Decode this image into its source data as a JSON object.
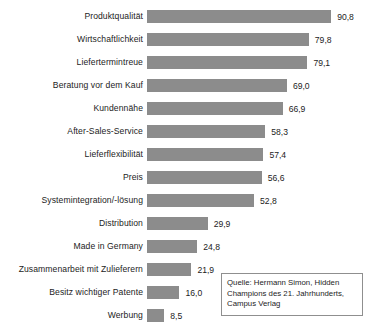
{
  "chart_data": {
    "type": "bar",
    "orientation": "horizontal",
    "title": "",
    "xlabel": "",
    "ylabel": "",
    "grid": false,
    "legend": null,
    "xlim": [
      0,
      100
    ],
    "value_format": "german-decimal-comma",
    "bar_color": "#8c8c8c",
    "categories": [
      "Produktqualität",
      "Wirtschaftlichkeit",
      "Liefertermintreue",
      "Beratung vor dem Kauf",
      "Kundennähe",
      "After-Sales-Service",
      "Lieferflexibilität",
      "Preis",
      "Systemintegration/-lösung",
      "Distribution",
      "Made in Germany",
      "Zusammenarbeit mit Zulieferern",
      "Besitz wichtiger Patente",
      "Werbung"
    ],
    "values": [
      90.8,
      79.8,
      79.1,
      69.0,
      66.9,
      58.3,
      57.4,
      56.6,
      52.8,
      29.9,
      24.8,
      21.9,
      16.0,
      8.5
    ],
    "value_labels": [
      "90,8",
      "79,8",
      "79,1",
      "69,0",
      "66,9",
      "58,3",
      "57,4",
      "56,6",
      "52,8",
      "29,9",
      "24,8",
      "21,9",
      "16,0",
      "8,5"
    ]
  },
  "source_box": {
    "lines": [
      "Quelle: Hermann Simon, Hidden",
      "Champions des 21. Jahrhunderts,",
      "Campus Verlag"
    ]
  },
  "bottom_caption": {
    "text": ""
  }
}
